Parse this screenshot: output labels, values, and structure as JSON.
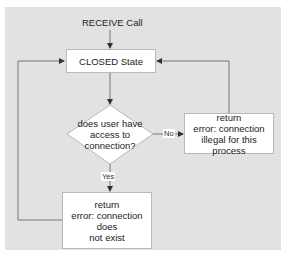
{
  "diagram": {
    "type": "flowchart",
    "start": {
      "label": "RECEIVE Call"
    },
    "nodes": [
      {
        "id": "closed",
        "shape": "rectangle",
        "label": "CLOSED State"
      },
      {
        "id": "decision",
        "shape": "diamond",
        "lines": [
          "does user have",
          "access to",
          "connection?"
        ]
      },
      {
        "id": "illegal",
        "shape": "rectangle",
        "lines": [
          "return",
          "error: connection",
          "illegal for this process"
        ]
      },
      {
        "id": "notexist",
        "shape": "rectangle",
        "lines": [
          "return",
          "error: connection does",
          "not exist"
        ]
      }
    ],
    "edges": [
      {
        "from": "start",
        "to": "closed",
        "label": ""
      },
      {
        "from": "closed",
        "to": "decision",
        "label": ""
      },
      {
        "from": "decision",
        "to": "illegal",
        "label": "No"
      },
      {
        "from": "decision",
        "to": "notexist",
        "label": "Yes"
      },
      {
        "from": "illegal",
        "to": "closed",
        "label": ""
      },
      {
        "from": "notexist",
        "to": "closed",
        "label": ""
      }
    ],
    "colors": {
      "background": "#e2e2e2",
      "node_fill": "#ffffff",
      "line": "#777777"
    }
  }
}
